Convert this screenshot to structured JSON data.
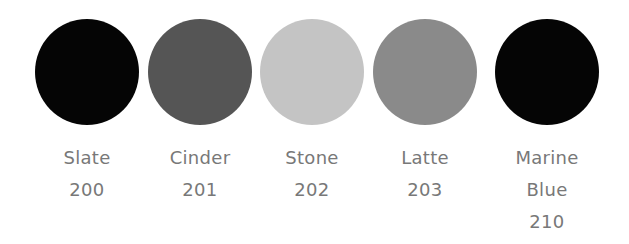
{
  "swatches": [
    {
      "name": "Slate",
      "code": "200",
      "color": "#050505"
    },
    {
      "name": "Cinder",
      "code": "201",
      "color": "#555555"
    },
    {
      "name": "Stone",
      "code": "202",
      "color": "#c4c4c4"
    },
    {
      "name": "Latte",
      "code": "203",
      "color": "#8a8a8a"
    },
    {
      "name_line1": "Marine",
      "name_line2": "Blue",
      "code": "210",
      "color": "#050505"
    }
  ]
}
